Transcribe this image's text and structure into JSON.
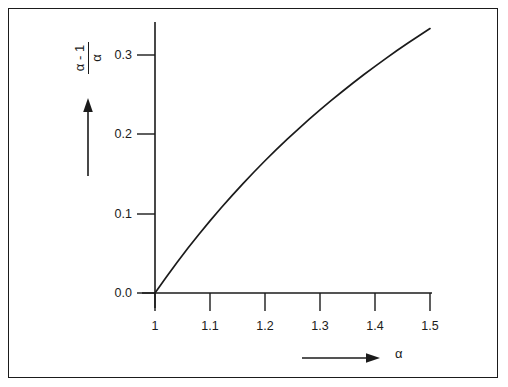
{
  "figure": {
    "background_color": "#ffffff",
    "line_color": "#1b1b1b",
    "frame_color": "#1b1b1b"
  },
  "axis_labels": {
    "y_numerator": "α - 1",
    "y_denominator": "α",
    "x_symbol": "α"
  },
  "chart_data": {
    "type": "line",
    "title": "",
    "subtitle": "",
    "xlabel": "α",
    "ylabel": "(α - 1) / α",
    "xlim": [
      1.0,
      1.5
    ],
    "ylim": [
      0.0,
      0.35
    ],
    "grid": false,
    "legend": null,
    "xticks": [
      1.0,
      1.1,
      1.2,
      1.3,
      1.4,
      1.5
    ],
    "xtick_labels": [
      "1",
      "1.1",
      "1.2",
      "1.3",
      "1.4",
      "1.5"
    ],
    "yticks": [
      0.0,
      0.1,
      0.2,
      0.3
    ],
    "ytick_labels": [
      "0.0",
      "0.1",
      "0.2",
      "0.3"
    ],
    "annotations": [
      {
        "name": "y-axis-arrow",
        "direction": "up"
      },
      {
        "name": "x-axis-arrow",
        "direction": "right"
      }
    ],
    "series": [
      {
        "name": "(α - 1) / α",
        "x": [
          1.0,
          1.02,
          1.04,
          1.06,
          1.08,
          1.1,
          1.12,
          1.14,
          1.16,
          1.18,
          1.2,
          1.22,
          1.24,
          1.26,
          1.28,
          1.3,
          1.32,
          1.34,
          1.36,
          1.38,
          1.4,
          1.42,
          1.44,
          1.46,
          1.48,
          1.5
        ],
        "values": [
          0.0,
          0.0196,
          0.0385,
          0.0566,
          0.0741,
          0.0909,
          0.1071,
          0.1228,
          0.1379,
          0.1525,
          0.1667,
          0.1803,
          0.1935,
          0.2063,
          0.2188,
          0.2308,
          0.2424,
          0.2537,
          0.2647,
          0.2754,
          0.2857,
          0.2958,
          0.3056,
          0.3151,
          0.3243,
          0.3333
        ]
      }
    ]
  }
}
